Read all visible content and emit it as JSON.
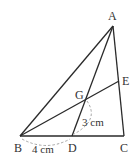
{
  "diagram": {
    "type": "geometry-triangle",
    "colors": {
      "stroke": "#2a2a2a",
      "dashed": "#9a9a9a",
      "text": "#333333",
      "background": "#ffffff"
    },
    "points": {
      "A": {
        "label": "A",
        "x": 113,
        "y": 26
      },
      "B": {
        "label": "B",
        "x": 20,
        "y": 136
      },
      "C": {
        "label": "C",
        "x": 124,
        "y": 136
      },
      "D": {
        "label": "D",
        "x": 72,
        "y": 136
      },
      "E": {
        "label": "E",
        "x": 119,
        "y": 81
      },
      "G": {
        "label": "G",
        "x": 85,
        "y": 99
      }
    },
    "segments": [
      "AB",
      "AC",
      "BC",
      "AD",
      "BE"
    ],
    "measurements": {
      "BD": "4 cm",
      "GD": "3 cm"
    }
  }
}
